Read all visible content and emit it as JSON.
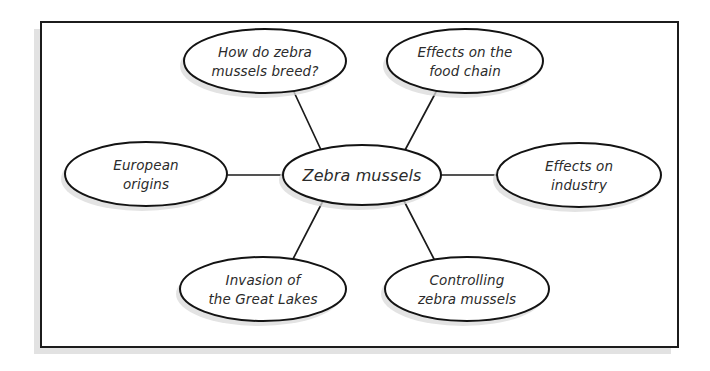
{
  "diagram": {
    "type": "mind-map",
    "center": {
      "id": "zebra-mussels",
      "label": "Zebra mussels",
      "cx": 362,
      "cy": 175,
      "rx": 79,
      "ry": 30
    },
    "nodes": [
      {
        "id": "how-do-zebra-mussels-breed",
        "label_line1": "How do zebra",
        "label_line2": "mussels breed?",
        "cx": 265,
        "cy": 61,
        "rx": 81,
        "ry": 32
      },
      {
        "id": "effects-on-the-food-chain",
        "label_line1": "Effects on the",
        "label_line2": "food chain",
        "cx": 465,
        "cy": 61,
        "rx": 78,
        "ry": 32
      },
      {
        "id": "european-origins",
        "label_line1": "European",
        "label_line2": "origins",
        "cx": 146,
        "cy": 174,
        "rx": 81,
        "ry": 32
      },
      {
        "id": "effects-on-industry",
        "label_line1": "Effects on",
        "label_line2": "industry",
        "cx": 579,
        "cy": 175,
        "rx": 82,
        "ry": 32
      },
      {
        "id": "invasion-of-the-great-lakes",
        "label_line1": "Invasion of",
        "label_line2": "the Great Lakes",
        "cx": 263,
        "cy": 289,
        "rx": 83,
        "ry": 32
      },
      {
        "id": "controlling-zebra-mussels",
        "label_line1": "Controlling",
        "label_line2": "zebra mussels",
        "cx": 467,
        "cy": 289,
        "rx": 82,
        "ry": 32
      }
    ],
    "connectors": [
      {
        "id": "connector-to-breed",
        "x1": 322,
        "y1": 152,
        "x2": 294,
        "y2": 92
      },
      {
        "id": "connector-to-food-chain",
        "x1": 404,
        "y1": 152,
        "x2": 436,
        "y2": 92
      },
      {
        "id": "connector-to-european-origins",
        "x1": 283,
        "y1": 175,
        "x2": 228,
        "y2": 175
      },
      {
        "id": "connector-to-industry",
        "x1": 441,
        "y1": 175,
        "x2": 497,
        "y2": 175
      },
      {
        "id": "connector-to-invasion",
        "x1": 324,
        "y1": 199,
        "x2": 293,
        "y2": 259
      },
      {
        "id": "connector-to-controlling",
        "x1": 403,
        "y1": 199,
        "x2": 434,
        "y2": 259
      }
    ],
    "frame": {
      "x": 41,
      "y": 22,
      "width": 637,
      "height": 325
    },
    "colors": {
      "node_fill": "#ffffff",
      "node_stroke": "#131313",
      "shadow": "#d9d9d9",
      "text": "#2b2b2b",
      "frame_stroke": "#1c1c1c",
      "background": "#ffffff"
    }
  }
}
